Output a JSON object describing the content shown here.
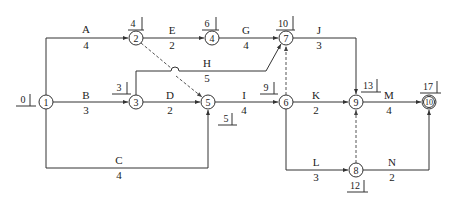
{
  "diagram": {
    "type": "double-code network (activity-on-arrow) diagram",
    "nodes": [
      {
        "id": "1",
        "label": "1",
        "time": "0"
      },
      {
        "id": "2",
        "label": "2",
        "time": "4"
      },
      {
        "id": "3",
        "label": "3",
        "time": "3"
      },
      {
        "id": "4",
        "label": "4",
        "time": "6"
      },
      {
        "id": "5",
        "label": "5",
        "time": "5"
      },
      {
        "id": "6",
        "label": "6",
        "time": "9"
      },
      {
        "id": "7",
        "label": "7",
        "time": "10"
      },
      {
        "id": "8",
        "label": "8",
        "time": "12"
      },
      {
        "id": "9",
        "label": "9",
        "time": "13"
      },
      {
        "id": "10",
        "label": "10",
        "time": "17"
      }
    ],
    "activities": [
      {
        "name": "A",
        "duration": "4",
        "from": "1",
        "to": "2"
      },
      {
        "name": "B",
        "duration": "3",
        "from": "1",
        "to": "3"
      },
      {
        "name": "C",
        "duration": "4",
        "from": "1",
        "to": "5"
      },
      {
        "name": "D",
        "duration": "2",
        "from": "3",
        "to": "5"
      },
      {
        "name": "E",
        "duration": "2",
        "from": "2",
        "to": "4"
      },
      {
        "name": "G",
        "duration": "4",
        "from": "4",
        "to": "7"
      },
      {
        "name": "H",
        "duration": "5",
        "from": "3",
        "to": "7"
      },
      {
        "name": "I",
        "duration": "4",
        "from": "5",
        "to": "6"
      },
      {
        "name": "J",
        "duration": "3",
        "from": "7",
        "to": "9"
      },
      {
        "name": "K",
        "duration": "2",
        "from": "6",
        "to": "9"
      },
      {
        "name": "L",
        "duration": "3",
        "from": "6",
        "to": "8"
      },
      {
        "name": "M",
        "duration": "4",
        "from": "9",
        "to": "10"
      },
      {
        "name": "N",
        "duration": "2",
        "from": "8",
        "to": "10"
      }
    ],
    "dummies": [
      {
        "from": "2",
        "to": "5"
      },
      {
        "from": "6",
        "to": "7"
      },
      {
        "from": "8",
        "to": "9"
      }
    ]
  }
}
